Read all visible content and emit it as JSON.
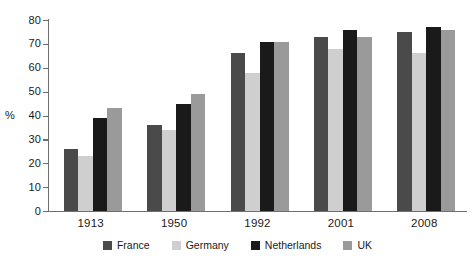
{
  "chart_data": {
    "type": "bar",
    "title": "",
    "subtitle": "",
    "xlabel": "",
    "ylabel": "%",
    "ylim": [
      0,
      80
    ],
    "yticks": [
      0,
      10,
      20,
      30,
      40,
      50,
      60,
      70,
      80
    ],
    "grid": false,
    "legend_position": "bottom",
    "categories": [
      "1913",
      "1950",
      "1992",
      "2001",
      "2008"
    ],
    "series": [
      {
        "name": "France",
        "color": "#4a4a4a",
        "values": [
          26,
          36,
          66,
          73,
          75
        ]
      },
      {
        "name": "Germany",
        "color": "#cfcfcf",
        "values": [
          23,
          34,
          58,
          68,
          66
        ]
      },
      {
        "name": "Netherlands",
        "color": "#1a1a1a",
        "values": [
          39,
          45,
          71,
          76,
          77
        ]
      },
      {
        "name": "UK",
        "color": "#9a9a9a",
        "values": [
          43,
          49,
          71,
          73,
          76
        ]
      }
    ]
  },
  "axis": {
    "unit_label": "%"
  }
}
